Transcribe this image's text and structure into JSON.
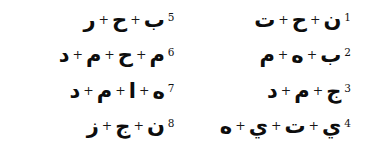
{
  "document": {
    "type": "arabic-letter-combination-worksheet",
    "text_direction": "rtl",
    "separator": "+",
    "ink_color": "#111111",
    "background_color": "#ffffff"
  },
  "columns": {
    "right": {
      "name": "first-column",
      "items": [
        {
          "number": "1",
          "letters": [
            "ن",
            "ح",
            "ت"
          ]
        },
        {
          "number": "2",
          "letters": [
            "ب",
            "ه",
            "م"
          ]
        },
        {
          "number": "3",
          "letters": [
            "ج",
            "م",
            "د"
          ]
        },
        {
          "number": "4",
          "letters": [
            "ي",
            "ت",
            "ي",
            "ه"
          ]
        }
      ]
    },
    "left": {
      "name": "second-column",
      "items": [
        {
          "number": "5",
          "letters": [
            "ب",
            "ح",
            "ر"
          ]
        },
        {
          "number": "6",
          "letters": [
            "م",
            "ح",
            "م",
            "د"
          ]
        },
        {
          "number": "7",
          "letters": [
            "ه",
            "ا",
            "م",
            "د"
          ]
        },
        {
          "number": "8",
          "letters": [
            "ن",
            "ج",
            "ز"
          ]
        }
      ]
    }
  }
}
